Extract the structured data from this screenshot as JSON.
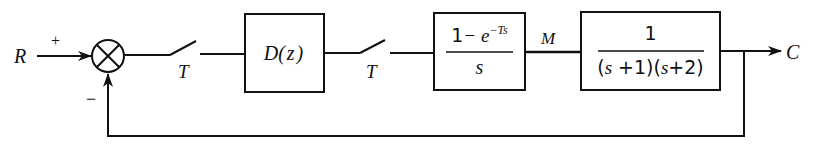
{
  "diagram": {
    "type": "sampled-data feedback control loop",
    "signals": {
      "input": "R",
      "output": "C",
      "intermediate": "M"
    },
    "summing_junction": {
      "plus_sign": "+",
      "minus_sign": "−"
    },
    "samplers": [
      {
        "label": "T"
      },
      {
        "label": "T"
      }
    ],
    "blocks": [
      {
        "id": "controller",
        "text": "D(z)",
        "name_part": "D",
        "arg": "(z)"
      },
      {
        "id": "zoh",
        "numerator_const": "1",
        "numerator_rest": "− e",
        "exponent": "−Ts",
        "denominator": "s"
      },
      {
        "id": "plant",
        "numerator": "1",
        "denominator_parts": [
          "(s",
          " +1)(s",
          "+2)"
        ]
      }
    ],
    "colors": {
      "stroke": "#111111",
      "background": "#ffffff"
    }
  }
}
